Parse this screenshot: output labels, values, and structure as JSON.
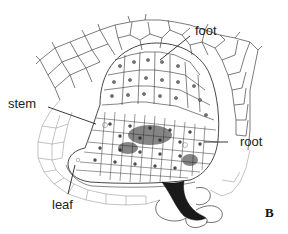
{
  "figure": {
    "panel_letter": "B",
    "labels": {
      "foot": "foot",
      "stem": "stem",
      "root": "root",
      "leaf": "leaf"
    },
    "colors": {
      "line": "#333333",
      "light_line": "#9a9a9a",
      "dark_fill": "#1a1a1a",
      "background": "#ffffff"
    }
  }
}
